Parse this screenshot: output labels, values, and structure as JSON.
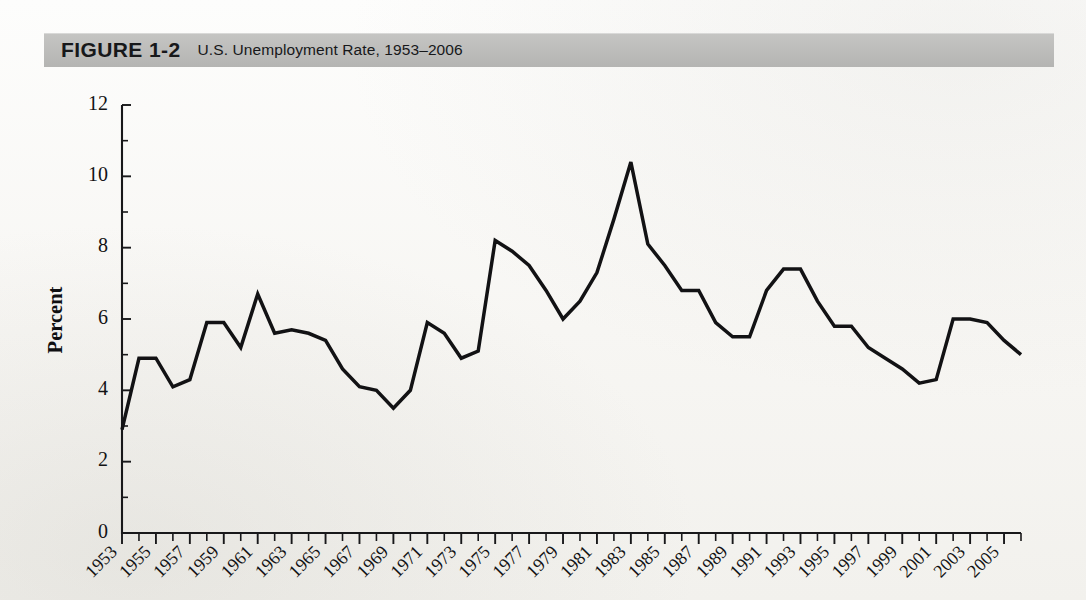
{
  "header": {
    "figure_label": "FIGURE 1-2",
    "title": "U.S. Unemployment Rate, 1953–2006",
    "bar_color": "#bdbdbb"
  },
  "chart_data": {
    "type": "line",
    "title": "U.S. Unemployment Rate, 1953–2006",
    "xlabel": "",
    "ylabel": "Percent",
    "ylim": [
      0,
      12
    ],
    "ytick_labels": [
      "0",
      "2",
      "4",
      "6",
      "8",
      "10",
      "12"
    ],
    "ytick_values": [
      0,
      2,
      4,
      6,
      8,
      10,
      12
    ],
    "xlim": [
      1953,
      2006
    ],
    "xtick_labels": [
      "1953",
      "1955",
      "1957",
      "1959",
      "1961",
      "1963",
      "1965",
      "1967",
      "1969",
      "1971",
      "1973",
      "1975",
      "1977",
      "1979",
      "1981",
      "1983",
      "1985",
      "1987",
      "1989",
      "1991",
      "1993",
      "1995",
      "1997",
      "1999",
      "2001",
      "2003",
      "2005"
    ],
    "xtick_values": [
      1953,
      1955,
      1957,
      1959,
      1961,
      1963,
      1965,
      1967,
      1969,
      1971,
      1973,
      1975,
      1977,
      1979,
      1981,
      1983,
      1985,
      1987,
      1989,
      1991,
      1993,
      1995,
      1997,
      1999,
      2001,
      2003,
      2005
    ],
    "xtick_rotation": 45,
    "grid": false,
    "legend": null,
    "line_color": "#121214",
    "x": [
      1953,
      1954,
      1955,
      1956,
      1957,
      1958,
      1959,
      1960,
      1961,
      1962,
      1963,
      1964,
      1965,
      1966,
      1967,
      1968,
      1969,
      1970,
      1971,
      1972,
      1973,
      1974,
      1975,
      1976,
      1977,
      1978,
      1979,
      1980,
      1981,
      1982,
      1983,
      1984,
      1985,
      1986,
      1987,
      1988,
      1989,
      1990,
      1991,
      1992,
      1993,
      1994,
      1995,
      1996,
      1997,
      1998,
      1999,
      2000,
      2001,
      2002,
      2003,
      2004,
      2005,
      2006
    ],
    "values": [
      2.9,
      4.9,
      4.9,
      4.1,
      4.3,
      5.9,
      5.9,
      5.2,
      6.7,
      5.6,
      5.7,
      5.6,
      5.4,
      4.6,
      4.1,
      4.0,
      3.5,
      4.0,
      5.9,
      5.6,
      4.9,
      5.1,
      8.2,
      7.9,
      7.5,
      6.8,
      6.0,
      6.5,
      7.3,
      8.8,
      10.4,
      8.1,
      7.5,
      6.8,
      6.8,
      5.9,
      5.5,
      5.5,
      6.8,
      7.4,
      7.4,
      6.5,
      5.8,
      5.8,
      5.2,
      4.9,
      4.6,
      4.2,
      4.3,
      6.0,
      6.0,
      5.9,
      5.4,
      5.0
    ]
  }
}
